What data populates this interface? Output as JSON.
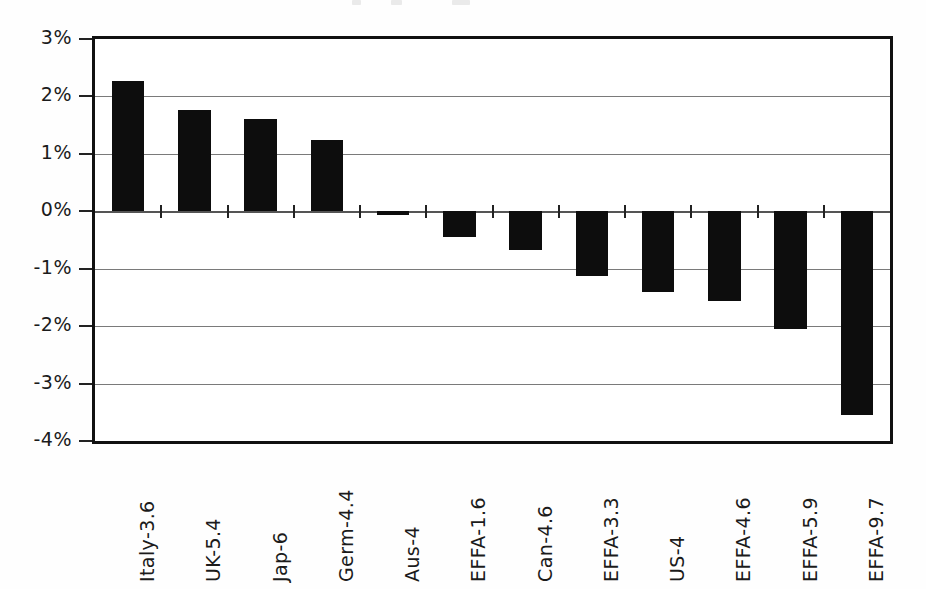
{
  "chart_data": {
    "type": "bar",
    "title": "",
    "subtitle": "",
    "xlabel": "",
    "ylabel": "",
    "categories": [
      "Italy-3.6",
      "UK-5.4",
      "Jap-6",
      "Germ-4.4",
      "Aus-4",
      "EFFA-1.6",
      "Can-4.6",
      "EFFA-3.3",
      "US-4",
      "EFFA-4.6",
      "EFFA-5.9",
      "EFFA-9.7"
    ],
    "values": [
      2.27,
      1.76,
      1.6,
      1.25,
      -0.07,
      -0.45,
      -0.67,
      -1.12,
      -1.4,
      -1.57,
      -2.05,
      -3.55
    ],
    "value_unit": "%",
    "ylim": [
      -4,
      3
    ],
    "ytick_values": [
      3,
      2,
      1,
      0,
      -1,
      -2,
      -3,
      -4
    ],
    "ytick_labels": [
      "3%",
      "2%",
      "1%",
      "0%",
      "-1%",
      "-2%",
      "-3%",
      "-4%"
    ],
    "grid": true,
    "grid_axis": "y",
    "legend": false,
    "legend_position": "none",
    "bar_color": "#0d0d0d",
    "series": [
      {
        "name": "",
        "values": [
          2.27,
          1.76,
          1.6,
          1.25,
          -0.07,
          -0.45,
          -0.67,
          -1.12,
          -1.4,
          -1.57,
          -2.05,
          -3.55
        ]
      }
    ],
    "annotations": []
  },
  "axes": {
    "y_ticks": [
      {
        "label": "3%",
        "value": 3
      },
      {
        "label": "2%",
        "value": 2
      },
      {
        "label": "1%",
        "value": 1
      },
      {
        "label": "0%",
        "value": 0
      },
      {
        "label": "-1%",
        "value": -1
      },
      {
        "label": "-2%",
        "value": -2
      },
      {
        "label": "-3%",
        "value": -3
      },
      {
        "label": "-4%",
        "value": -4
      }
    ]
  }
}
